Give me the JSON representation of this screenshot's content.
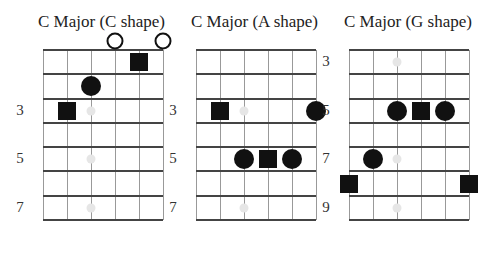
{
  "diagrams": [
    {
      "title": "C Major (C shape)",
      "left": 43,
      "fret_labels": [
        {
          "row": 3,
          "text": "3"
        },
        {
          "row": 5,
          "text": "5"
        },
        {
          "row": 7,
          "text": "7"
        }
      ],
      "inlays": [
        {
          "string": 3,
          "row": 3
        },
        {
          "string": 3,
          "row": 5
        },
        {
          "string": 3,
          "row": 7
        }
      ],
      "open_strings": [
        4,
        6
      ],
      "notes": [
        {
          "string": 5,
          "row": 1,
          "shape": "square",
          "role": "root"
        },
        {
          "string": 3,
          "row": 2,
          "shape": "circle"
        },
        {
          "string": 2,
          "row": 3,
          "shape": "square",
          "role": "root"
        }
      ]
    },
    {
      "title": "C Major (A shape)",
      "left": 196,
      "fret_labels": [
        {
          "row": 3,
          "text": "3"
        },
        {
          "row": 5,
          "text": "5"
        },
        {
          "row": 7,
          "text": "7"
        }
      ],
      "inlays": [
        {
          "string": 3,
          "row": 3
        },
        {
          "string": 3,
          "row": 5
        },
        {
          "string": 3,
          "row": 7
        }
      ],
      "open_strings": [],
      "notes": [
        {
          "string": 2,
          "row": 3,
          "shape": "square",
          "role": "root"
        },
        {
          "string": 6,
          "row": 3,
          "shape": "circle"
        },
        {
          "string": 3,
          "row": 5,
          "shape": "circle"
        },
        {
          "string": 4,
          "row": 5,
          "shape": "square",
          "role": "root"
        },
        {
          "string": 5,
          "row": 5,
          "shape": "circle"
        }
      ]
    },
    {
      "title": "C Major (G shape)",
      "left": 349,
      "fret_labels": [
        {
          "row": 1,
          "text": "3"
        },
        {
          "row": 3,
          "text": "5"
        },
        {
          "row": 5,
          "text": "7"
        },
        {
          "row": 7,
          "text": "9"
        }
      ],
      "inlays": [
        {
          "string": 3,
          "row": 1
        },
        {
          "string": 3,
          "row": 3
        },
        {
          "string": 3,
          "row": 5
        },
        {
          "string": 3,
          "row": 7
        }
      ],
      "open_strings": [],
      "notes": [
        {
          "string": 3,
          "row": 3,
          "shape": "circle"
        },
        {
          "string": 4,
          "row": 3,
          "shape": "square",
          "role": "root"
        },
        {
          "string": 5,
          "row": 3,
          "shape": "circle"
        },
        {
          "string": 2,
          "row": 5,
          "shape": "circle"
        },
        {
          "string": 1,
          "row": 6,
          "shape": "square",
          "role": "root"
        },
        {
          "string": 6,
          "row": 6,
          "shape": "square",
          "role": "root"
        }
      ]
    }
  ],
  "legend": {
    "square": "root note (C)",
    "circle": "chord tone",
    "open_circle": "open string",
    "light_dot": "fret inlay marker"
  }
}
